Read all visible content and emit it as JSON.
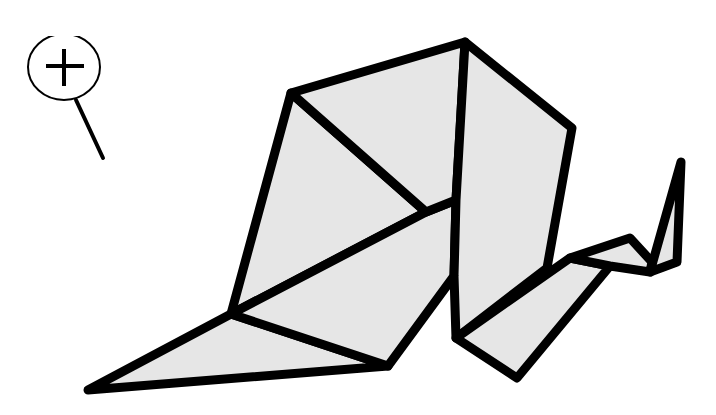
{
  "figure": {
    "fill_color": "#e6e6e6",
    "stroke_color": "#000000",
    "background": "#ffffff"
  },
  "zoom_control": {
    "icon": "zoom-in-icon",
    "label": "Zoom in"
  },
  "shapes": {
    "body_top": "291,93 465,42 456,200 426,212",
    "body_left": "291,93 426,212 231,314",
    "body_center": "231,314 426,212 456,200 454,276 388,366",
    "back_panel": "465,42 572,128 547,268 456,338 454,276 456,200",
    "beak": "88,390 231,314 388,366",
    "neck": "456,338 570,258 610,266 517,378",
    "head": "570,258 630,238 652,262 650,272 610,266",
    "tail": "650,272 681,162 677,262"
  },
  "lines": {
    "crease": "231,314 426,212"
  }
}
